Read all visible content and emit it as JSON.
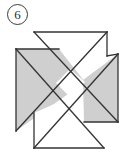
{
  "page": {
    "background_color": "#ffffff",
    "width": 133,
    "height": 156
  },
  "badge": {
    "name": "problem-number",
    "label": "6",
    "shape": "circle",
    "border_color": "#3a3a3a",
    "text_color": "#2b2b2b"
  },
  "figure": {
    "name": "tangram-pinwheel",
    "title": "",
    "stroke_color": "#333333",
    "stroke_width": 1.3,
    "fill_gray": "#cfcfcf",
    "fill_white": "#ffffff",
    "pieces": [
      {
        "id": "piece-top-white-triangle",
        "label": "top white triangle",
        "fill": "#ffffff",
        "points": "34,32 107,32 70,69"
      },
      {
        "id": "piece-right-upper-white-triangle",
        "label": "right upper white triangle",
        "fill": "#ffffff",
        "points": "107,32 107,56 83,80 70,69"
      },
      {
        "id": "piece-right-gray-triangle",
        "label": "right gray triangle",
        "fill": "#cfcfcf",
        "points": "118,54 118,122 84,122 83,80"
      },
      {
        "id": "piece-left-gray-quad",
        "label": "left gray quadrilateral",
        "fill": "#cfcfcf",
        "points": "16,49 59,49 85,82 16,131"
      },
      {
        "id": "piece-center-white-square",
        "label": "center white square",
        "fill": "#ffffff",
        "points": "70,69 85,82 70,97 56,83"
      },
      {
        "id": "piece-bottom-white-triangle",
        "label": "bottom white triangle",
        "fill": "#ffffff",
        "points": "34,113 104,148 34,148"
      },
      {
        "id": "piece-lower-white-triangle",
        "label": "lower middle white triangle",
        "fill": "#ffffff",
        "points": "34,113 70,97 84,111 49,130"
      }
    ],
    "outline_segments": [
      {
        "id": "seg-top",
        "label": "top edge",
        "points": "34,32 107,32"
      },
      {
        "id": "seg-right-upper",
        "label": "upper right vertical",
        "points": "107,32 107,56"
      },
      {
        "id": "seg-right-apex",
        "label": "right triangle apex edge",
        "points": "107,56 118,54"
      },
      {
        "id": "seg-right-side",
        "label": "right vertical",
        "points": "118,54 118,122"
      },
      {
        "id": "seg-right-bottom",
        "label": "right bottom edge",
        "points": "118,122 84,122"
      },
      {
        "id": "seg-bottom-diag",
        "label": "bottom diagonal",
        "points": "104,148 34,148"
      },
      {
        "id": "seg-bottom-left",
        "label": "bottom left vertical",
        "points": "34,148 34,113"
      },
      {
        "id": "seg-left-vert",
        "label": "left vertical",
        "points": "16,131 16,49"
      },
      {
        "id": "seg-left-top",
        "label": "left top edge",
        "points": "16,49 59,49"
      },
      {
        "id": "seg-diag-main",
        "label": "main diagonal",
        "points": "34,32 118,122"
      },
      {
        "id": "seg-diag-cross",
        "label": "cross diagonal",
        "points": "104,148 16,49"
      },
      {
        "id": "seg-diag-three",
        "label": "third diagonal",
        "points": "107,32 16,131"
      },
      {
        "id": "seg-diag-four",
        "label": "fourth diagonal",
        "points": "118,54 34,148"
      }
    ]
  }
}
